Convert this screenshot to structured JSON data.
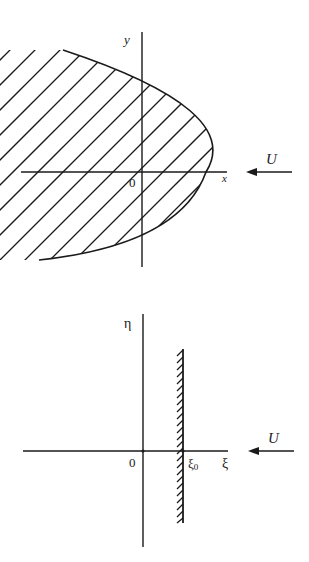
{
  "figure_top": {
    "axis_x_label": "x",
    "axis_y_label": "y",
    "origin_label": "0",
    "flow_label": "U",
    "description": "Parabolic body (hatched) in the physical z-plane, flow U from right to left"
  },
  "figure_bottom": {
    "axis_x_label": "ξ",
    "axis_y_label": "η",
    "origin_label": "0",
    "wall_position_label": "ξ",
    "wall_position_subscript": "0",
    "flow_label": "U",
    "description": "Mapped plane: vertical hatched wall at ξ = ξ0, flow U from right to left"
  },
  "colors": {
    "line": "#1a1a1a",
    "background": "#ffffff"
  }
}
